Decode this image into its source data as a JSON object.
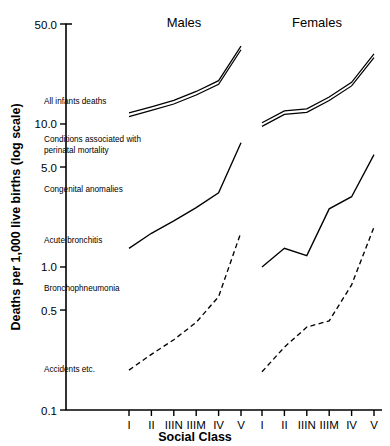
{
  "chart_data": {
    "type": "line",
    "title": "",
    "xlabel": "Social Class",
    "ylabel": "Deaths per 1,000 live births (log scale)",
    "scale": "log",
    "ylim": [
      0.1,
      50.0
    ],
    "grid": false,
    "legend_position": "inline-labels",
    "ytick_labels": [
      "50.0",
      "10.0",
      "5.0",
      "1.0",
      "0.5",
      "0.1"
    ],
    "ytick_values": [
      50.0,
      10.0,
      5.0,
      1.0,
      0.5,
      0.1
    ],
    "categories": [
      "I",
      "II",
      "IIIN",
      "IIIM",
      "IV",
      "V"
    ],
    "panels": [
      {
        "name": "Males",
        "label": "Males",
        "series": [
          {
            "name": "All infants deaths",
            "style": "double-band",
            "values": [
              11.6,
              12.8,
              14.2,
              16.4,
              19.5,
              34.0
            ]
          },
          {
            "name": "Congenital anomalies",
            "style": "solid",
            "values": [
              1.35,
              1.72,
              2.1,
              2.6,
              3.3,
              7.4
            ]
          },
          {
            "name": "Accidents etc.",
            "style": "dashed",
            "values": [
              0.19,
              0.245,
              0.31,
              0.41,
              0.62,
              1.75
            ]
          }
        ]
      },
      {
        "name": "Females",
        "label": "Females",
        "series": [
          {
            "name": "All infants deaths",
            "style": "double-band",
            "values": [
              9.9,
              12.0,
              12.4,
              15.0,
              19.0,
              30.0
            ]
          },
          {
            "name": "Congenital anomalies",
            "style": "solid",
            "values": [
              1.0,
              1.35,
              1.2,
              2.55,
              3.1,
              6.1
            ]
          },
          {
            "name": "Accidents etc.",
            "style": "dashed",
            "values": [
              0.185,
              0.275,
              0.38,
              0.42,
              0.75,
              1.9
            ]
          }
        ]
      }
    ],
    "series_annotations": [
      {
        "key": "all_infants",
        "label": "All infants deaths"
      },
      {
        "key": "perinatal",
        "label": "Conditions associated with"
      },
      {
        "key": "perinatal2",
        "label": "perinatal mortality"
      },
      {
        "key": "congenital",
        "label": "Congenital anomalies"
      },
      {
        "key": "bronchitis",
        "label": "Acute bronchitis"
      },
      {
        "key": "bronchopneumonia",
        "label": "Bronchophneumonia"
      },
      {
        "key": "accidents",
        "label": "Accidents etc."
      }
    ]
  },
  "colors": {
    "ink": "#000000",
    "background": "#ffffff"
  }
}
